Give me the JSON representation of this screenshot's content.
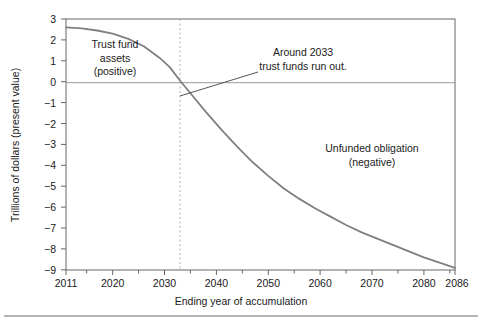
{
  "chart_data": {
    "type": "line",
    "title": "",
    "xlabel": "Ending year of accumulation",
    "ylabel": "Trillions of dollars (present value)",
    "xlim": [
      2011,
      2086
    ],
    "ylim": [
      -9,
      3
    ],
    "grid": false,
    "legend": "none",
    "xticks": [
      2011,
      2020,
      2030,
      2040,
      2050,
      2060,
      2070,
      2080,
      2086
    ],
    "xtick_labels": [
      "2011",
      "2020",
      "2030",
      "2040",
      "2050",
      "2060",
      "2070",
      "2080",
      "2086"
    ],
    "xminor_ticks": [
      2015,
      2025,
      2035,
      2045,
      2055,
      2065,
      2075,
      2085
    ],
    "yticks": [
      3,
      2,
      1,
      0,
      -1,
      -2,
      -3,
      -4,
      -5,
      -6,
      -7,
      -8,
      -9
    ],
    "ytick_labels": [
      "3",
      "2",
      "1",
      "0",
      "−1",
      "−2",
      "−3",
      "−4",
      "−5",
      "−6",
      "−7",
      "−8",
      "−9"
    ],
    "series": [
      {
        "name": "Trust fund balance (present value)",
        "color": "#808080",
        "x": [
          2011,
          2014,
          2017,
          2020,
          2023,
          2026,
          2029,
          2031,
          2033,
          2035,
          2038,
          2041,
          2044,
          2047,
          2050,
          2053,
          2056,
          2059,
          2062,
          2065,
          2068,
          2071,
          2074,
          2077,
          2080,
          2083,
          2086
        ],
        "values": [
          2.6,
          2.55,
          2.45,
          2.3,
          2.05,
          1.7,
          1.15,
          0.7,
          0.05,
          -0.55,
          -1.45,
          -2.3,
          -3.1,
          -3.85,
          -4.5,
          -5.1,
          -5.6,
          -6.05,
          -6.45,
          -6.85,
          -7.2,
          -7.5,
          -7.8,
          -8.1,
          -8.4,
          -8.65,
          -8.9
        ]
      }
    ],
    "zero_line": {
      "value": 0,
      "color": "#999999"
    },
    "marker_line": {
      "x": 2033,
      "style": "dashed",
      "color": "#aaaaaa"
    },
    "annotations": [
      {
        "name": "trust-fund-assets-label",
        "lines": [
          "Trust fund",
          "assets",
          "(positive)"
        ],
        "x": 115,
        "y": 48
      },
      {
        "name": "run-out-callout",
        "lines": [
          "Around 2033",
          "trust funds run out."
        ],
        "x": 303,
        "y": 56
      },
      {
        "name": "unfunded-obligation-label",
        "lines": [
          "Unfunded obligation",
          "(negative)"
        ],
        "x": 364,
        "y": 152
      }
    ],
    "callout_leader": {
      "from": [
        258,
        72
      ],
      "to": [
        180,
        96
      ]
    }
  },
  "figure": {
    "frame_color": "#666666",
    "curve_color": "#808080",
    "text_color": "#1a1a1a",
    "background": "#ffffff",
    "bottom_rule_color": "#6b6b6b"
  }
}
